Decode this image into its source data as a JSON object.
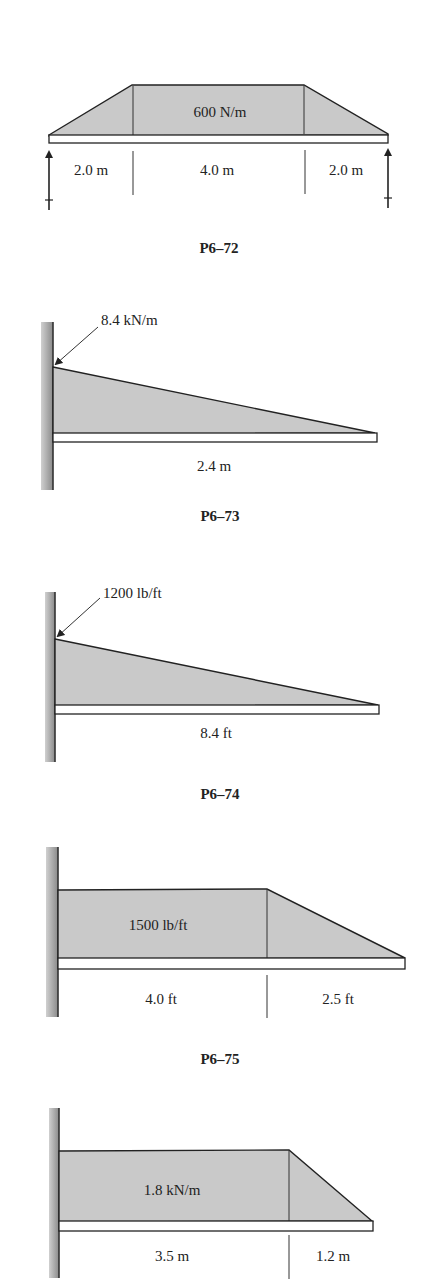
{
  "figures": [
    {
      "caption": "P6–72",
      "type": "simply-supported beam with trapezoidal distributed load",
      "load_label": "600 N/m",
      "dimensions": [
        "2.0 m",
        "4.0 m",
        "2.0 m"
      ]
    },
    {
      "caption": "P6–73",
      "type": "cantilever with triangular distributed load",
      "load_label": "8.4 kN/m",
      "dimensions": [
        "2.4 m"
      ]
    },
    {
      "caption": "P6–74",
      "type": "cantilever with triangular distributed load",
      "load_label": "1200 lb/ft",
      "dimensions": [
        "8.4 ft"
      ]
    },
    {
      "caption": "P6–75",
      "type": "cantilever with uniform + linearly decreasing load",
      "load_label": "1500 lb/ft",
      "dimensions": [
        "4.0 ft",
        "2.5 ft"
      ]
    },
    {
      "caption": "",
      "type": "cantilever with uniform + linearly decreasing load",
      "load_label": "1.8 kN/m",
      "dimensions": [
        "3.5 m",
        "1.2 m"
      ]
    }
  ],
  "colors": {
    "load_fill": "#c9c9c9",
    "wall_fill": "#9a9a9a",
    "line": "#222222"
  }
}
